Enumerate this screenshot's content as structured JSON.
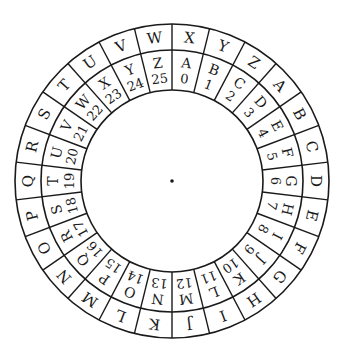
{
  "geometry": {
    "center_x": 172,
    "center_y": 181,
    "outer_radius": 157,
    "middle_radius": 131,
    "inner_radius": 91,
    "segments": 26,
    "start_angle_deg": 0
  },
  "colors": {
    "ink": "#1a1a1a",
    "background": "#ffffff"
  },
  "outer_ring": {
    "letters": [
      "X",
      "Y",
      "Z",
      "A",
      "B",
      "C",
      "D",
      "E",
      "F",
      "G",
      "H",
      "I",
      "J",
      "K",
      "L",
      "M",
      "N",
      "O",
      "P",
      "Q",
      "R",
      "S",
      "T",
      "U",
      "V",
      "W"
    ]
  },
  "inner_ring": {
    "letters": [
      "A",
      "B",
      "C",
      "D",
      "E",
      "F",
      "G",
      "H",
      "I",
      "J",
      "K",
      "L",
      "M",
      "N",
      "O",
      "P",
      "Q",
      "R",
      "S",
      "T",
      "U",
      "V",
      "W",
      "X",
      "Y",
      "Z"
    ],
    "numbers": [
      "0",
      "1",
      "2",
      "3",
      "4",
      "5",
      "6",
      "7",
      "8",
      "9",
      "10",
      "11",
      "12",
      "13",
      "14",
      "15",
      "16",
      "17",
      "18",
      "19",
      "20",
      "21",
      "22",
      "23",
      "24",
      "25"
    ]
  },
  "center_dot": {
    "label": "center pivot"
  }
}
